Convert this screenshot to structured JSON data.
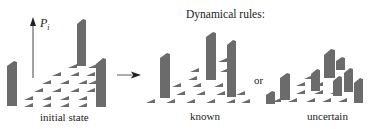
{
  "title": "Dynamical rules:",
  "axis_label": {
    "symbol": "P",
    "subscript": "i"
  },
  "connector_word": "or",
  "panels": [
    {
      "id": "initial",
      "label": "initial state"
    },
    {
      "id": "known",
      "label": "known"
    },
    {
      "id": "uncertain",
      "label": "uncertain"
    }
  ],
  "colors": {
    "bar": "#6b6b6b",
    "bar_top": "#8a8a8a",
    "arrow": "#444444",
    "text": "#222222"
  },
  "icons": {
    "axis": "up-arrow-icon",
    "transition": "right-arrow-icon"
  }
}
